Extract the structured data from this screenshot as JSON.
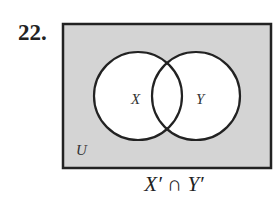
{
  "problem": {
    "number": "22.",
    "caption_parts": [
      "X′",
      "∩",
      "Y′"
    ],
    "caption": "X′ ∩ Y′"
  },
  "diagram": {
    "universe_label": "U",
    "sets": [
      {
        "label": "X"
      },
      {
        "label": "Y"
      }
    ],
    "shaded_region": "outside both X and Y",
    "colors": {
      "shade": "#d4d4d4",
      "line": "#222222",
      "unshaded": "#ffffff"
    }
  }
}
